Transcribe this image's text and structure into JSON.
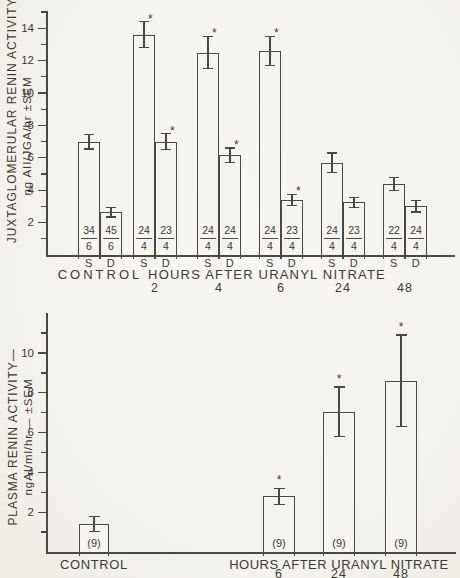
{
  "figure": {
    "background_color": "#f4f2ed",
    "line_color": "#4a4843",
    "text_color": "#3c3a36",
    "significance_marker": "*"
  },
  "chart_data": [
    {
      "type": "bar",
      "panel": "top",
      "ylabel_lines": [
        "JUXTAGLOMERULAR RENIN ACTIVITY—",
        "ng AII/JGA/hr ±SEM"
      ],
      "ylim": [
        0,
        15
      ],
      "ytick_labels": [
        2,
        4,
        6,
        8,
        10,
        12,
        14
      ],
      "grid": "off",
      "xlabel": "HOURS AFTER URANYL NITRATE",
      "bar_series_labels": [
        "S",
        "D"
      ],
      "significance_marker": "*",
      "groups": [
        {
          "name": "CONTROL",
          "bars": [
            {
              "series": "S",
              "value": 7.0,
              "sem": 0.45,
              "significant": false,
              "n_top": "34",
              "n_bottom": "6"
            },
            {
              "series": "D",
              "value": 2.65,
              "sem": 0.3,
              "significant": false,
              "n_top": "45",
              "n_bottom": "6"
            }
          ]
        },
        {
          "name": "2",
          "bars": [
            {
              "series": "S",
              "value": 13.6,
              "sem": 0.8,
              "significant": true,
              "n_top": "24",
              "n_bottom": "4"
            },
            {
              "series": "D",
              "value": 7.0,
              "sem": 0.5,
              "significant": true,
              "n_top": "23",
              "n_bottom": "4"
            }
          ]
        },
        {
          "name": "4",
          "bars": [
            {
              "series": "S",
              "value": 12.5,
              "sem": 1.0,
              "significant": true,
              "n_top": "24",
              "n_bottom": "4"
            },
            {
              "series": "D",
              "value": 6.15,
              "sem": 0.45,
              "significant": true,
              "n_top": "24",
              "n_bottom": "4"
            }
          ]
        },
        {
          "name": "6",
          "bars": [
            {
              "series": "S",
              "value": 12.6,
              "sem": 0.9,
              "significant": true,
              "n_top": "24",
              "n_bottom": "4"
            },
            {
              "series": "D",
              "value": 3.4,
              "sem": 0.35,
              "significant": true,
              "n_top": "23",
              "n_bottom": "4"
            }
          ]
        },
        {
          "name": "24",
          "bars": [
            {
              "series": "S",
              "value": 5.7,
              "sem": 0.6,
              "significant": false,
              "n_top": "24",
              "n_bottom": "4"
            },
            {
              "series": "D",
              "value": 3.25,
              "sem": 0.3,
              "significant": false,
              "n_top": "23",
              "n_bottom": "4"
            }
          ]
        },
        {
          "name": "48",
          "bars": [
            {
              "series": "S",
              "value": 4.4,
              "sem": 0.4,
              "significant": false,
              "n_top": "22",
              "n_bottom": "4"
            },
            {
              "series": "D",
              "value": 3.0,
              "sem": 0.35,
              "significant": false,
              "n_top": "24",
              "n_bottom": "4"
            }
          ]
        }
      ]
    },
    {
      "type": "bar",
      "panel": "bottom",
      "ylabel_lines": [
        "PLASMA RENIN ACTIVITY—",
        "ngAI/ml/hr — ±SEM"
      ],
      "ylim": [
        0,
        12
      ],
      "ytick_labels": [
        2,
        4,
        6,
        8,
        10
      ],
      "grid": "off",
      "xlabel": "HOURS AFTER URANYL NITRATE",
      "significance_marker": "*",
      "groups": [
        {
          "name": "CONTROL",
          "bars": [
            {
              "value": 1.4,
              "sem": 0.37,
              "significant": false,
              "n_label": "(9)"
            }
          ]
        },
        {
          "name": "6",
          "bars": [
            {
              "value": 2.8,
              "sem": 0.4,
              "significant": true,
              "n_label": "(9)"
            }
          ]
        },
        {
          "name": "24",
          "bars": [
            {
              "value": 7.05,
              "sem": 1.25,
              "significant": true,
              "n_label": "(9)"
            }
          ]
        },
        {
          "name": "48",
          "bars": [
            {
              "value": 8.6,
              "sem": 2.3,
              "significant": true,
              "n_label": "(9)"
            }
          ]
        }
      ]
    }
  ]
}
